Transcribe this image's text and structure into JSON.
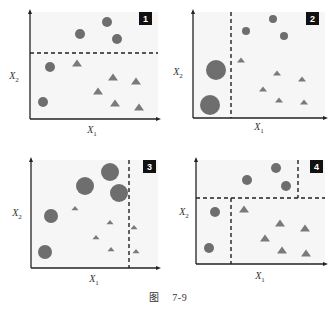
{
  "figure": {
    "caption_prefix": "图",
    "caption_number": "7-9"
  },
  "style": {
    "plot_bg": "#f6f6f6",
    "axis_color": "#222222",
    "circle_color": "#6e6e6e",
    "triangle_color": "#7a7a7a",
    "dash_color": "#222222",
    "badge_bg": "#111111",
    "badge_fg": "#ffffff"
  },
  "chart_data": [
    {
      "type": "scatter",
      "panel": "1",
      "xlabel": "X1",
      "ylabel": "X2",
      "box": {
        "x0": 30,
        "y0": 12,
        "x1": 158,
        "y1": 119
      },
      "badge": {
        "x": 139,
        "y": 12
      },
      "xlabel_pos": {
        "x": 92,
        "y": 133
      },
      "ylabel_pos": {
        "x": 14,
        "y": 79
      },
      "splits": [
        {
          "orient": "h",
          "pos": 53,
          "from": 30,
          "to": 158
        }
      ],
      "circles": [
        {
          "cx": 107,
          "cy": 22,
          "r": 5
        },
        {
          "cx": 80,
          "cy": 34,
          "r": 5
        },
        {
          "cx": 117,
          "cy": 39,
          "r": 5
        },
        {
          "cx": 50,
          "cy": 67,
          "r": 5
        },
        {
          "cx": 43,
          "cy": 102,
          "r": 5
        }
      ],
      "triangles": [
        {
          "cx": 77,
          "cy": 63,
          "s": 8
        },
        {
          "cx": 113,
          "cy": 77,
          "s": 8
        },
        {
          "cx": 136,
          "cy": 81,
          "s": 8
        },
        {
          "cx": 98,
          "cy": 91,
          "s": 8
        },
        {
          "cx": 115,
          "cy": 103,
          "s": 8
        },
        {
          "cx": 139,
          "cy": 107,
          "s": 8
        }
      ]
    },
    {
      "type": "scatter",
      "panel": "2",
      "xlabel": "X1",
      "ylabel": "X2",
      "box": {
        "x0": 193,
        "y0": 12,
        "x1": 325,
        "y1": 118
      },
      "badge": {
        "x": 306,
        "y": 12
      },
      "xlabel_pos": {
        "x": 259,
        "y": 130
      },
      "ylabel_pos": {
        "x": 178,
        "y": 75
      },
      "splits": [
        {
          "orient": "v",
          "pos": 231,
          "from": 12,
          "to": 118
        }
      ],
      "circles": [
        {
          "cx": 273,
          "cy": 19,
          "r": 4
        },
        {
          "cx": 246,
          "cy": 31,
          "r": 4
        },
        {
          "cx": 284,
          "cy": 36,
          "r": 4
        },
        {
          "cx": 216,
          "cy": 70,
          "r": 10
        },
        {
          "cx": 210,
          "cy": 105,
          "r": 10
        }
      ],
      "triangles": [
        {
          "cx": 241,
          "cy": 60,
          "s": 6
        },
        {
          "cx": 277,
          "cy": 73,
          "s": 6
        },
        {
          "cx": 302,
          "cy": 79,
          "s": 6
        },
        {
          "cx": 263,
          "cy": 89,
          "s": 6
        },
        {
          "cx": 279,
          "cy": 100,
          "s": 6
        },
        {
          "cx": 304,
          "cy": 102,
          "s": 6
        }
      ]
    },
    {
      "type": "scatter",
      "panel": "3",
      "xlabel": "X1",
      "ylabel": "X2",
      "box": {
        "x0": 31,
        "y0": 160,
        "x1": 158,
        "y1": 268
      },
      "badge": {
        "x": 143,
        "y": 160
      },
      "xlabel_pos": {
        "x": 94,
        "y": 282
      },
      "ylabel_pos": {
        "x": 17,
        "y": 216
      },
      "splits": [
        {
          "orient": "v",
          "pos": 129,
          "from": 160,
          "to": 268
        }
      ],
      "circles": [
        {
          "cx": 110,
          "cy": 172,
          "r": 9
        },
        {
          "cx": 85,
          "cy": 186,
          "r": 9
        },
        {
          "cx": 119,
          "cy": 193,
          "r": 9
        },
        {
          "cx": 51,
          "cy": 216,
          "r": 7
        },
        {
          "cx": 45,
          "cy": 252,
          "r": 7
        }
      ],
      "triangles": [
        {
          "cx": 75,
          "cy": 208,
          "s": 5
        },
        {
          "cx": 110,
          "cy": 222,
          "s": 5
        },
        {
          "cx": 134,
          "cy": 227,
          "s": 5
        },
        {
          "cx": 96,
          "cy": 237,
          "s": 5
        },
        {
          "cx": 111,
          "cy": 249,
          "s": 5
        },
        {
          "cx": 136,
          "cy": 251,
          "s": 5
        }
      ]
    },
    {
      "type": "scatter",
      "panel": "4",
      "xlabel": "X1",
      "ylabel": "X2",
      "box": {
        "x0": 196,
        "y0": 160,
        "x1": 325,
        "y1": 264
      },
      "badge": {
        "x": 310,
        "y": 160
      },
      "xlabel_pos": {
        "x": 260,
        "y": 279
      },
      "ylabel_pos": {
        "x": 184,
        "y": 215
      },
      "splits": [
        {
          "orient": "h",
          "pos": 198,
          "from": 196,
          "to": 325
        },
        {
          "orient": "v",
          "pos": 231,
          "from": 198,
          "to": 264
        },
        {
          "orient": "v",
          "pos": 298,
          "from": 160,
          "to": 198
        }
      ],
      "circles": [
        {
          "cx": 276,
          "cy": 168,
          "r": 5
        },
        {
          "cx": 247,
          "cy": 180,
          "r": 5
        },
        {
          "cx": 286,
          "cy": 186,
          "r": 5
        },
        {
          "cx": 215,
          "cy": 212,
          "r": 5
        },
        {
          "cx": 209,
          "cy": 248,
          "r": 5
        }
      ],
      "triangles": [
        {
          "cx": 244,
          "cy": 209,
          "s": 8
        },
        {
          "cx": 280,
          "cy": 223,
          "s": 8
        },
        {
          "cx": 305,
          "cy": 228,
          "s": 8
        },
        {
          "cx": 265,
          "cy": 238,
          "s": 8
        },
        {
          "cx": 282,
          "cy": 250,
          "s": 8
        },
        {
          "cx": 306,
          "cy": 253,
          "s": 8
        }
      ]
    }
  ]
}
